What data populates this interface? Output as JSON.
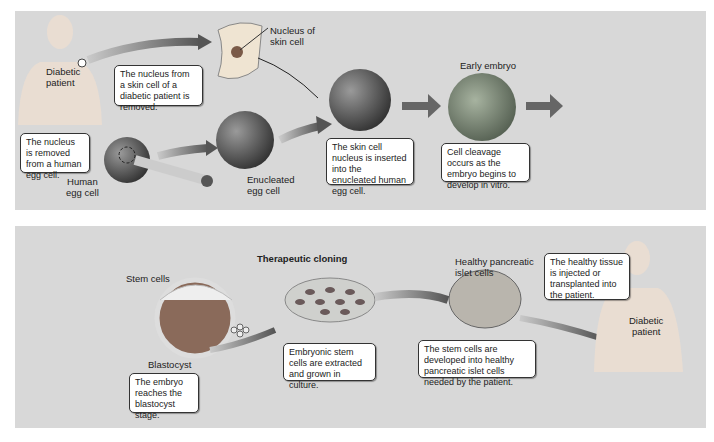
{
  "top_panel": {
    "labels": {
      "patient": "Diabetic\npatient",
      "nucleus_of_skin_cell": "Nucleus of\nskin cell",
      "human_egg_cell": "Human\negg cell",
      "enucleated_egg_cell": "Enucleated\negg cell",
      "early_embryo": "Early embryo"
    },
    "callouts": {
      "skin_nucleus_removed": "The nucleus from a skin cell of a diabetic patient is removed.",
      "egg_nucleus_removed": "The nucleus is removed from a human egg cell.",
      "nucleus_inserted": "The skin cell nucleus is inserted into the enucleated human egg cell.",
      "cleavage": "Cell cleavage occurs as the embryo begins to develop in vitro."
    }
  },
  "bottom_panel": {
    "title": "Therapeutic cloning",
    "labels": {
      "stem_cells": "Stem cells",
      "blastocyst": "Blastocyst",
      "islet_cells": "Healthy pancreatic\nislet cells",
      "patient": "Diabetic\npatient"
    },
    "callouts": {
      "blastocyst_stage": "The embryo reaches the blastocyst stage.",
      "extracted": "Embryonic stem cells are extracted and grown in culture.",
      "developed": "The stem cells are developed into healthy pancreatic islet cells needed by the patient.",
      "injected": "The healthy tissue is injected or transplanted into the patient."
    }
  },
  "colors": {
    "panel_bg": "#d8d8d8",
    "arrow": "#6b6b6b",
    "cell": "#5a5a5a",
    "skin": "#e8dccf"
  }
}
